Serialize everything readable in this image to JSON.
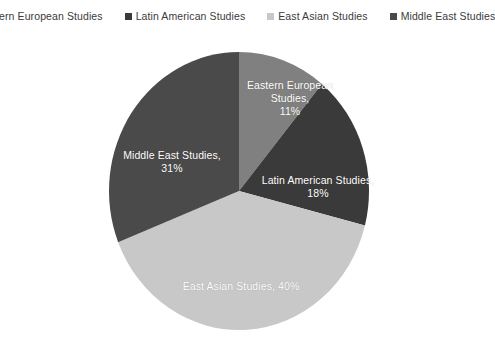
{
  "chart_data": {
    "type": "pie",
    "title": "",
    "categories": [
      "Eastern European Studies",
      "Latin American Studies",
      "East Asian Studies",
      "Middle East Studies"
    ],
    "values": [
      11,
      18,
      40,
      31
    ],
    "value_suffix": "%",
    "start_angle_deg": 0,
    "direction": "clockwise",
    "legend_position": "top",
    "grid": false,
    "colors": [
      "#808080",
      "#3a3a3a",
      "#c8c8c8",
      "#4a4a4a"
    ],
    "label_color": "#ffffff",
    "background": "#ffffff",
    "slices": [
      {
        "name": "Eastern European Studies",
        "value": 11,
        "percent_text": "11%",
        "color": "#808080",
        "data_label": "Eastern European\nStudies,\n11%"
      },
      {
        "name": "Latin American Studies",
        "value": 18,
        "percent_text": "18%",
        "color": "#3a3a3a",
        "data_label": "Latin American Studies,\n18%"
      },
      {
        "name": "East Asian Studies",
        "value": 40,
        "percent_text": "40%",
        "color": "#c8c8c8",
        "data_label": "East Asian Studies, 40%"
      },
      {
        "name": "Middle East Studies",
        "value": 31,
        "percent_text": "31%",
        "color": "#4a4a4a",
        "data_label": "Middle East Studies,\n31%"
      }
    ]
  },
  "legend": {
    "items": [
      {
        "label": "Eastern European Studies",
        "color": "#808080"
      },
      {
        "label": "Latin American Studies",
        "color": "#3a3a3a"
      },
      {
        "label": "East Asian Studies",
        "color": "#c8c8c8"
      },
      {
        "label": "Middle East Studies",
        "color": "#4a4a4a"
      }
    ]
  }
}
